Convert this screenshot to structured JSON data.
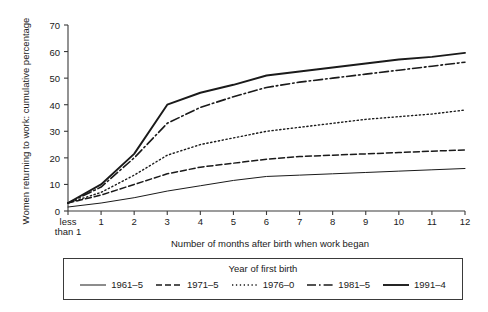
{
  "chart_data": {
    "type": "line",
    "title": "",
    "xlabel": "Number of months after birth when work began",
    "ylabel": "Women returning to work: cumulative percentage",
    "ylim": [
      0,
      70
    ],
    "yticks": [
      0,
      10,
      20,
      30,
      40,
      50,
      60,
      70
    ],
    "xlim": [
      0,
      12
    ],
    "x": [
      0,
      1,
      2,
      3,
      4,
      5,
      6,
      7,
      8,
      9,
      10,
      11,
      12
    ],
    "xticklabels": [
      "less\nthan 1",
      "1",
      "2",
      "3",
      "4",
      "5",
      "6",
      "7",
      "8",
      "9",
      "10",
      "11",
      "12"
    ],
    "grid": false,
    "legend_position": "below",
    "legend_title": "Year of first birth",
    "series": [
      {
        "name": "1961–5",
        "style": "solid-thin",
        "values": [
          1.5,
          3.0,
          5.0,
          7.5,
          9.5,
          11.5,
          13.0,
          13.5,
          14.0,
          14.5,
          15.0,
          15.5,
          16.0
        ]
      },
      {
        "name": "1971–5",
        "style": "dashed",
        "values": [
          3.0,
          6.0,
          10.0,
          14.0,
          16.5,
          18.0,
          19.5,
          20.5,
          21.0,
          21.5,
          22.0,
          22.5,
          23.0
        ]
      },
      {
        "name": "1976–0",
        "style": "dotted",
        "values": [
          3.0,
          7.0,
          13.5,
          21.0,
          25.0,
          27.5,
          30.0,
          31.5,
          33.0,
          34.5,
          35.5,
          36.5,
          38.0
        ]
      },
      {
        "name": "1981–5",
        "style": "dash-dot",
        "values": [
          3.0,
          9.0,
          20.0,
          33.0,
          39.0,
          43.0,
          46.5,
          48.5,
          50.0,
          51.5,
          53.0,
          54.5,
          56.0
        ]
      },
      {
        "name": "1991–4",
        "style": "solid-thick",
        "values": [
          3.0,
          10.0,
          21.5,
          40.0,
          44.5,
          47.5,
          51.0,
          52.5,
          54.0,
          55.5,
          57.0,
          58.0,
          59.5
        ]
      }
    ]
  },
  "colors": {
    "axis": "#3a3a3a",
    "line": "#1a1a1a",
    "background": "#ffffff"
  }
}
